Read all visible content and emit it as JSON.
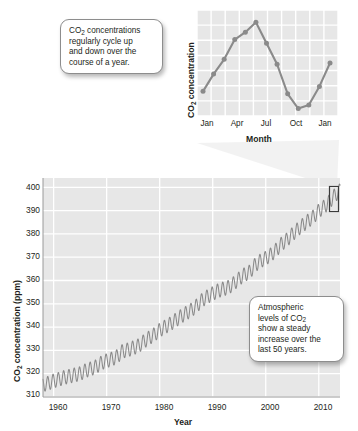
{
  "figure": {
    "background_color": "#ffffff",
    "plot_background_color": "#e7e7e7",
    "gridline_color": "#ffffff",
    "line_color": "#8a8a8a",
    "text_color": "#231f20"
  },
  "callouts": [
    {
      "name": "cycle-callout",
      "lines": [
        "CO",
        "2",
        " concentrations",
        "regularly cycle up",
        "and down over the",
        "course of a year."
      ],
      "text": "CO2 concentrations regularly cycle up and down over the course of a year."
    },
    {
      "name": "trend-callout",
      "text": "Atmospheric levels of CO2 show a steady increase over the last 50 years."
    }
  ],
  "callout_cycle": {
    "l1a": "CO",
    "l1sub": "2",
    "l1b": " concentrations",
    "l2": "regularly cycle up",
    "l3": "and down over the",
    "l4": "course of a year."
  },
  "callout_trend": {
    "l1": "Atmospheric",
    "l2a": "levels of CO",
    "l2sub": "2",
    "l3": "show a steady",
    "l4": "increase over the",
    "l5": "last 50 years."
  },
  "chart_data": [
    {
      "name": "inset-seasonal-cycle",
      "type": "line",
      "title": "",
      "xlabel": "Month",
      "ylabel": "CO2 concentration",
      "ylabel_display": {
        "pre": "CO",
        "sub": "2",
        "post": " concentration"
      },
      "x": [
        "Jan",
        "Feb",
        "Mar",
        "Apr",
        "May",
        "Jun",
        "Jul",
        "Aug",
        "Sep",
        "Oct",
        "Nov",
        "Dec",
        "Jan"
      ],
      "tick_labels": [
        "Jan",
        "Apr",
        "Jul",
        "Oct",
        "Jan"
      ],
      "tick_positions": [
        0,
        3,
        6,
        9,
        12
      ],
      "values": [
        2.0,
        3.4,
        4.6,
        6.2,
        6.8,
        7.6,
        5.9,
        4.2,
        1.8,
        0.6,
        0.9,
        2.4,
        4.3
      ],
      "ylim": [
        0,
        8.6
      ],
      "y_axis_ticks_shown": false,
      "grid": true,
      "markers": true,
      "legend": "none"
    },
    {
      "name": "main-keeling-curve",
      "type": "line",
      "title": "",
      "xlabel": "Year",
      "ylabel": "CO2 concentration (ppm)",
      "ylabel_display": {
        "pre": "CO",
        "sub": "2",
        "post": " concentration (ppm)"
      },
      "xlim": [
        1958,
        2014
      ],
      "ylim": [
        310,
        404
      ],
      "ytick_labels": [
        "310",
        "320",
        "330",
        "340",
        "350",
        "360",
        "370",
        "380",
        "390",
        "400"
      ],
      "ytick_values": [
        310,
        320,
        330,
        340,
        350,
        360,
        370,
        380,
        390,
        400
      ],
      "xtick_labels": [
        "1960",
        "1970",
        "1980",
        "1990",
        "2000",
        "2010"
      ],
      "xtick_values": [
        1960,
        1970,
        1980,
        1990,
        2000,
        2010
      ],
      "grid": true,
      "legend": "none",
      "series_description": "Annual-cycle sawtooth superimposed on a steadily rising trend (Keeling curve)",
      "annual_oscillation_amplitude_ppm": 3.0,
      "annual_mean_values": [
        {
          "year": 1958,
          "ppm": 315.3
        },
        {
          "year": 1959,
          "ppm": 315.9
        },
        {
          "year": 1960,
          "ppm": 316.9
        },
        {
          "year": 1961,
          "ppm": 317.6
        },
        {
          "year": 1962,
          "ppm": 318.4
        },
        {
          "year": 1963,
          "ppm": 318.9
        },
        {
          "year": 1964,
          "ppm": 319.5
        },
        {
          "year": 1965,
          "ppm": 320.0
        },
        {
          "year": 1966,
          "ppm": 321.3
        },
        {
          "year": 1967,
          "ppm": 322.1
        },
        {
          "year": 1968,
          "ppm": 323.0
        },
        {
          "year": 1969,
          "ppm": 324.6
        },
        {
          "year": 1970,
          "ppm": 325.6
        },
        {
          "year": 1971,
          "ppm": 326.3
        },
        {
          "year": 1972,
          "ppm": 327.4
        },
        {
          "year": 1973,
          "ppm": 329.7
        },
        {
          "year": 1974,
          "ppm": 330.2
        },
        {
          "year": 1975,
          "ppm": 331.1
        },
        {
          "year": 1976,
          "ppm": 332.0
        },
        {
          "year": 1977,
          "ppm": 333.8
        },
        {
          "year": 1978,
          "ppm": 335.4
        },
        {
          "year": 1979,
          "ppm": 336.8
        },
        {
          "year": 1980,
          "ppm": 338.7
        },
        {
          "year": 1981,
          "ppm": 340.1
        },
        {
          "year": 1982,
          "ppm": 341.4
        },
        {
          "year": 1983,
          "ppm": 343.0
        },
        {
          "year": 1984,
          "ppm": 344.6
        },
        {
          "year": 1985,
          "ppm": 346.0
        },
        {
          "year": 1986,
          "ppm": 347.4
        },
        {
          "year": 1987,
          "ppm": 349.2
        },
        {
          "year": 1988,
          "ppm": 351.6
        },
        {
          "year": 1989,
          "ppm": 353.1
        },
        {
          "year": 1990,
          "ppm": 354.4
        },
        {
          "year": 1991,
          "ppm": 355.6
        },
        {
          "year": 1992,
          "ppm": 356.4
        },
        {
          "year": 1993,
          "ppm": 357.1
        },
        {
          "year": 1994,
          "ppm": 358.8
        },
        {
          "year": 1995,
          "ppm": 360.8
        },
        {
          "year": 1996,
          "ppm": 362.6
        },
        {
          "year": 1997,
          "ppm": 363.7
        },
        {
          "year": 1998,
          "ppm": 366.7
        },
        {
          "year": 1999,
          "ppm": 368.4
        },
        {
          "year": 2000,
          "ppm": 369.6
        },
        {
          "year": 2001,
          "ppm": 371.1
        },
        {
          "year": 2002,
          "ppm": 373.2
        },
        {
          "year": 2003,
          "ppm": 375.8
        },
        {
          "year": 2004,
          "ppm": 377.5
        },
        {
          "year": 2005,
          "ppm": 379.8
        },
        {
          "year": 2006,
          "ppm": 381.9
        },
        {
          "year": 2007,
          "ppm": 383.8
        },
        {
          "year": 2008,
          "ppm": 385.6
        },
        {
          "year": 2009,
          "ppm": 387.4
        },
        {
          "year": 2010,
          "ppm": 389.9
        },
        {
          "year": 2011,
          "ppm": 391.6
        },
        {
          "year": 2012,
          "ppm": 393.8
        },
        {
          "year": 2013,
          "ppm": 396.5
        },
        {
          "year": 2014,
          "ppm": 398.6
        }
      ]
    }
  ]
}
